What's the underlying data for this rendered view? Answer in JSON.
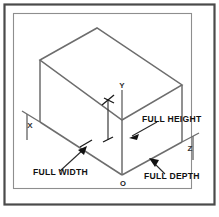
{
  "figure": {
    "background_color": "#ffffff",
    "line_color": "#6d6d6d",
    "text_color": "#111111",
    "frame": {
      "outer_color": "#4a4a4a",
      "inner_color": "#8e8e8e"
    }
  },
  "axes": {
    "x_label": "X",
    "y_label": "Y",
    "z_label": "Z",
    "origin_label": "O"
  },
  "callouts": [
    {
      "id": "full-height",
      "label": "FULL HEIGHT"
    },
    {
      "id": "full-width",
      "label": "FULL WIDTH"
    },
    {
      "id": "full-depth",
      "label": "FULL DEPTH"
    }
  ]
}
